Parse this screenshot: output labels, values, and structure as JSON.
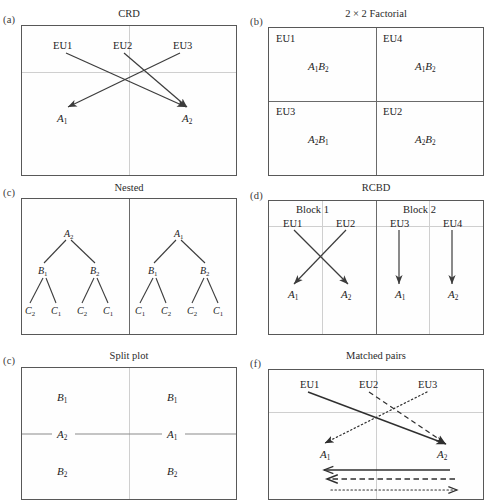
{
  "figure": {
    "panels": [
      {
        "tag": "(a)",
        "title": "CRD",
        "eu": [
          "EU1",
          "EU2",
          "EU3"
        ],
        "treatments": [
          "A1",
          "A2"
        ]
      },
      {
        "tag": "(b)",
        "title": "2 × 2 Factorial",
        "cells": [
          {
            "eu": "EU1",
            "treatment_a": "A",
            "treatment_a_sub": "1",
            "treatment_b": "B",
            "treatment_b_sub": "2"
          },
          {
            "eu": "EU4",
            "treatment_a": "A",
            "treatment_a_sub": "1",
            "treatment_b": "B",
            "treatment_b_sub": "2"
          },
          {
            "eu": "EU3",
            "treatment_a": "A",
            "treatment_a_sub": "2",
            "treatment_b": "B",
            "treatment_b_sub": "1"
          },
          {
            "eu": "EU2",
            "treatment_a": "A",
            "treatment_a_sub": "2",
            "treatment_b": "B",
            "treatment_b_sub": "2"
          }
        ]
      },
      {
        "tag": "(c)",
        "title": "Nested",
        "trees": [
          {
            "root": "A",
            "root_sub": "2",
            "branches": [
              {
                "label": "B",
                "sub": "1",
                "leaves": [
                  {
                    "label": "C",
                    "sub": "2"
                  },
                  {
                    "label": "C",
                    "sub": "1"
                  }
                ]
              },
              {
                "label": "B",
                "sub": "2",
                "leaves": [
                  {
                    "label": "C",
                    "sub": "2"
                  },
                  {
                    "label": "C",
                    "sub": "1"
                  }
                ]
              }
            ]
          },
          {
            "root": "A",
            "root_sub": "1",
            "branches": [
              {
                "label": "B",
                "sub": "1",
                "leaves": [
                  {
                    "label": "C",
                    "sub": "1"
                  },
                  {
                    "label": "C",
                    "sub": "2"
                  }
                ]
              },
              {
                "label": "B",
                "sub": "2",
                "leaves": [
                  {
                    "label": "C",
                    "sub": "2"
                  },
                  {
                    "label": "C",
                    "sub": "1"
                  }
                ]
              }
            ]
          }
        ]
      },
      {
        "tag": "(d)",
        "title": "RCBD",
        "blocks": [
          {
            "label": "Block 1",
            "eu": [
              "EU1",
              "EU2"
            ],
            "treatments": [
              "A1",
              "A2"
            ]
          },
          {
            "label": "Block 2",
            "eu": [
              "EU3",
              "EU4"
            ],
            "treatments": [
              "A1",
              "A2"
            ]
          }
        ]
      },
      {
        "tag": "(c)",
        "title": "Split plot",
        "left": {
          "top": "B1",
          "mid": "A2",
          "bottom": "B2"
        },
        "right": {
          "top": "B1",
          "mid": "A1",
          "bottom": "B2"
        }
      },
      {
        "tag": "(f)",
        "title": "Matched pairs",
        "eu": [
          "EU1",
          "EU2",
          "EU3"
        ],
        "treatments": [
          "A1",
          "A2"
        ],
        "line_styles": [
          "solid",
          "dashed",
          "dotted"
        ]
      }
    ]
  },
  "labels": {
    "a_title": "CRD",
    "a_tag": "(a)",
    "a_eu1": "EU1",
    "a_eu2": "EU2",
    "a_eu3": "EU3",
    "a_A1": "A",
    "a_A1s": "1",
    "a_A2": "A",
    "a_A2s": "2",
    "b_title": "2 × 2 Factorial",
    "b_tag": "(b)",
    "b_eu1": "EU1",
    "b_eu4": "EU4",
    "b_eu3": "EU3",
    "b_eu2": "EU2",
    "b_c1a": "A",
    "b_c1as": "1",
    "b_c1b": "B",
    "b_c1bs": "2",
    "b_c2a": "A",
    "b_c2as": "1",
    "b_c2b": "B",
    "b_c2bs": "2",
    "b_c3a": "A",
    "b_c3as": "2",
    "b_c3b": "B",
    "b_c3bs": "1",
    "b_c4a": "A",
    "b_c4as": "2",
    "b_c4b": "B",
    "b_c4bs": "2",
    "c_title": "Nested",
    "c_tag": "(c)",
    "cL_root": "A",
    "cL_roots": "2",
    "cL_b1": "B",
    "cL_b1s": "1",
    "cL_b2": "B",
    "cL_b2s": "2",
    "cL_l1": "C",
    "cL_l1s": "2",
    "cL_l2": "C",
    "cL_l2s": "1",
    "cL_l3": "C",
    "cL_l3s": "2",
    "cL_l4": "C",
    "cL_l4s": "1",
    "cR_root": "A",
    "cR_roots": "1",
    "cR_b1": "B",
    "cR_b1s": "1",
    "cR_b2": "B",
    "cR_b2s": "2",
    "cR_l1": "C",
    "cR_l1s": "1",
    "cR_l2": "C",
    "cR_l2s": "2",
    "cR_l3": "C",
    "cR_l3s": "2",
    "cR_l4": "C",
    "cR_l4s": "1",
    "d_title": "RCBD",
    "d_tag": "(d)",
    "d_block1": "Block 1",
    "d_block2": "Block 2",
    "d_eu1": "EU1",
    "d_eu2": "EU2",
    "d_eu3": "EU3",
    "d_eu4": "EU4",
    "d_A1": "A",
    "d_A1s": "1",
    "d_A2": "A",
    "d_A2s": "2",
    "d_A3": "A",
    "d_A3s": "1",
    "d_A4": "A",
    "d_A4s": "2",
    "e_title": "Split plot",
    "e_tag": "(c)",
    "e_lb1": "B",
    "e_lb1s": "1",
    "e_la": "A",
    "e_las": "2",
    "e_lb2": "B",
    "e_lb2s": "2",
    "e_rb1": "B",
    "e_rb1s": "1",
    "e_ra": "A",
    "e_ras": "1",
    "e_rb2": "B",
    "e_rb2s": "2",
    "f_title": "Matched pairs",
    "f_tag": "(f)",
    "f_eu1": "EU1",
    "f_eu2": "EU2",
    "f_eu3": "EU3",
    "f_A1": "A",
    "f_A1s": "1",
    "f_A2": "A",
    "f_A2s": "2"
  },
  "colors": {
    "border": "#585858",
    "grid": "#cfcfcf",
    "divider": "#6a6a6a",
    "ink": "#1d1d1d",
    "arrow": "#3c3c3c"
  }
}
